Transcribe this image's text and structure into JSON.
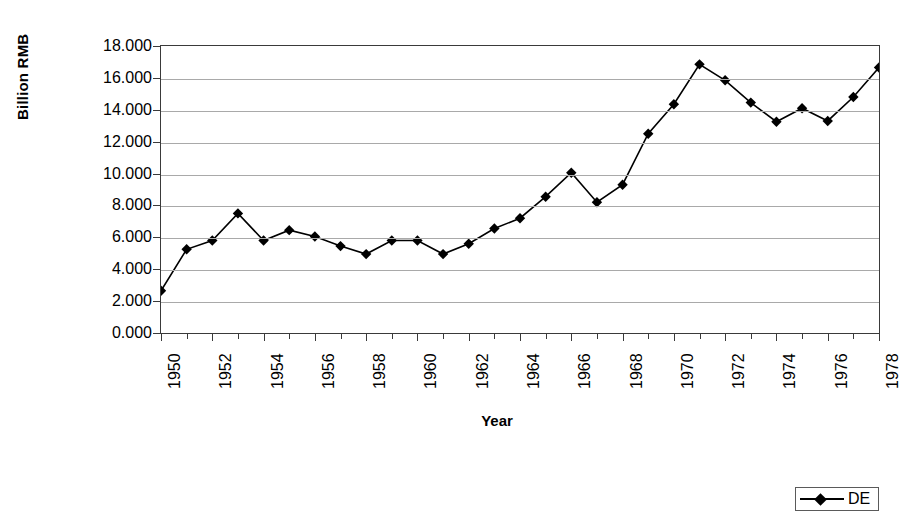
{
  "chart_data": {
    "type": "line",
    "title": "",
    "xlabel": "Year",
    "ylabel": "Billion RMB",
    "xlim": [
      1950,
      1978
    ],
    "ylim": [
      0,
      18
    ],
    "ytick_step": 2,
    "grid": "horizontal",
    "legend_position": "bottom-right",
    "marker": "diamond",
    "series_color": "#000000",
    "gridline_color": "#a9a9a9",
    "axis_color": "#3a3a3a",
    "y_ticks": [
      "0.000",
      "2.000",
      "4.000",
      "6.000",
      "8.000",
      "10.000",
      "12.000",
      "14.000",
      "16.000",
      "18.000"
    ],
    "x_tick_labels": [
      "1950",
      "1952",
      "1954",
      "1956",
      "1958",
      "1960",
      "1962",
      "1964",
      "1966",
      "1968",
      "1970",
      "1972",
      "1974",
      "1976",
      "1978"
    ],
    "legend": [
      {
        "name": "DE"
      }
    ],
    "x": [
      1950,
      1951,
      1952,
      1953,
      1954,
      1955,
      1956,
      1957,
      1958,
      1959,
      1960,
      1961,
      1962,
      1963,
      1964,
      1965,
      1966,
      1967,
      1968,
      1969,
      1970,
      1971,
      1972,
      1973,
      1974,
      1975,
      1976,
      1977,
      1978
    ],
    "series": [
      {
        "name": "DE",
        "values": [
          2.65,
          5.25,
          5.8,
          7.5,
          5.8,
          6.45,
          6.05,
          5.45,
          4.95,
          5.8,
          5.8,
          4.95,
          5.6,
          6.55,
          7.2,
          8.55,
          10.05,
          8.2,
          9.3,
          12.5,
          14.35,
          16.85,
          15.85,
          14.45,
          13.25,
          14.1,
          13.3,
          14.8,
          16.65
        ]
      }
    ]
  }
}
